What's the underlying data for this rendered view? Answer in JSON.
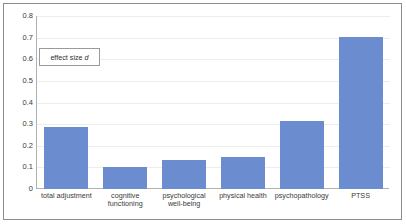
{
  "legend": {
    "label_plain": "effect size",
    "label_italic": "d"
  },
  "chart_data": {
    "type": "bar",
    "title": "",
    "subtitle": "",
    "xlabel": "",
    "ylabel": "",
    "ylim": [
      0,
      0.8
    ],
    "grid": true,
    "legend_position": "inside-top-left",
    "legend_entries": [
      "effect size d"
    ],
    "bar_color": "#6c8cd0",
    "yticks": [
      "0",
      "0.1",
      "0.2",
      "0.3",
      "0.4",
      "0.5",
      "0.6",
      "0.7",
      "0.8"
    ],
    "ytick_values": [
      0,
      0.1,
      0.2,
      0.3,
      0.4,
      0.5,
      0.6,
      0.7,
      0.8
    ],
    "categories": [
      "total adjustment",
      "cognitive\nfunctioning",
      "psychological\nwell-being",
      "physical health",
      "psychopathology",
      "PTSS"
    ],
    "values": [
      0.285,
      0.1,
      0.135,
      0.15,
      0.315,
      0.705
    ]
  }
}
